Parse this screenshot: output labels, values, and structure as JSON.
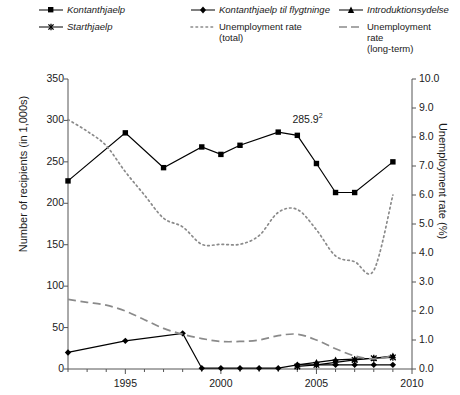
{
  "legend": {
    "rows": [
      [
        {
          "marker": "square-marker-line",
          "label": "Kontanthjaelp",
          "italic": true
        },
        {
          "marker": "diamond-marker-line",
          "label": "Kontanthjaelp til flygtninge",
          "italic": true
        },
        {
          "marker": "triangle-marker-line",
          "label": "Introduktionsydelse",
          "italic": true
        }
      ],
      [
        {
          "marker": "cross-marker-line",
          "label": "Starthjaelp",
          "italic": true
        },
        {
          "marker": "dotted-line",
          "label": "Unemployment rate\n(total)",
          "italic": false
        },
        {
          "marker": "dashed-line",
          "label": "Unemployment rate\n(long-term)",
          "italic": false
        }
      ]
    ]
  },
  "chart_data": {
    "type": "line",
    "title": "",
    "xlabel": "",
    "ylabel": "Number of recipients (in 1,000s)",
    "y2label": "Unemployment rate (%)",
    "xlim": [
      1992,
      2010
    ],
    "ylim": [
      0,
      350
    ],
    "y2lim": [
      0.0,
      10.0
    ],
    "xticks": [
      1995,
      2000,
      2005,
      2010
    ],
    "xtick_labels": [
      "1995",
      "2000",
      "2005",
      "2010"
    ],
    "yticks": [
      0,
      50,
      100,
      150,
      200,
      250,
      300,
      350
    ],
    "ytick_labels": [
      "0",
      "50",
      "100",
      "150",
      "200",
      "250",
      "300",
      "350"
    ],
    "y2ticks": [
      0.0,
      1.0,
      2.0,
      3.0,
      4.0,
      5.0,
      6.0,
      7.0,
      8.0,
      9.0,
      10.0
    ],
    "y2tick_labels": [
      "0.0",
      "1.0",
      "2.0",
      "3.0",
      "4.0",
      "5.0",
      "6.0",
      "7.0",
      "8.0",
      "9.0",
      "10.0"
    ],
    "x_minor_step": 1,
    "grid": false,
    "legend_position": "top",
    "annotations": [
      {
        "name": "peak-value-label",
        "text": "285.9",
        "superscript": "2",
        "x": 2005,
        "y": 285.9
      }
    ],
    "series": [
      {
        "name": "Kontanthjaelp",
        "axis": "left",
        "style": "solid",
        "marker": "square",
        "color": "#000000",
        "x": [
          1992,
          1993,
          1994,
          1995,
          1996,
          1997,
          1998,
          1999,
          2000,
          2001,
          2002,
          2003,
          2004,
          2005,
          2006,
          2007,
          2008,
          2009
        ],
        "y": [
          227,
          null,
          null,
          285,
          null,
          243,
          null,
          268,
          259,
          270,
          null,
          285.9,
          282,
          248,
          213,
          213,
          null,
          250
        ]
      },
      {
        "name": "Kontanthjaelp til flygtninge",
        "axis": "left",
        "style": "solid",
        "marker": "diamond",
        "color": "#000000",
        "x": [
          1992,
          1995,
          1998,
          1999,
          2000,
          2001,
          2002,
          2003,
          2004,
          2005,
          2006,
          2007,
          2008,
          2009
        ],
        "y": [
          20,
          34,
          43,
          1,
          1,
          1,
          1,
          1,
          5,
          5,
          5,
          5,
          5,
          5
        ]
      },
      {
        "name": "Introduktionsydelse",
        "axis": "left",
        "style": "solid",
        "marker": "triangle",
        "color": "#000000",
        "x": [
          2004,
          2005,
          2006,
          2007,
          2008,
          2009
        ],
        "y": [
          5,
          8,
          11,
          12,
          13,
          16
        ]
      },
      {
        "name": "Starthjaelp",
        "axis": "left",
        "style": "solid",
        "marker": "cross",
        "color": "#000000",
        "x": [
          2004,
          2005,
          2006,
          2007,
          2008,
          2009
        ],
        "y": [
          3,
          5,
          8,
          11,
          13,
          14
        ]
      },
      {
        "name": "Unemployment rate (total)",
        "axis": "right",
        "style": "dotted",
        "marker": "none",
        "color": "#8a8a8a",
        "x": [
          1992,
          1993,
          1994,
          1995,
          1996,
          1997,
          1998,
          1999,
          2000,
          2001,
          2002,
          2003,
          2004,
          2005,
          2006,
          2007,
          2008,
          2009
        ],
        "y": [
          8.6,
          8.2,
          7.7,
          6.8,
          6.0,
          5.2,
          4.9,
          4.3,
          4.3,
          4.3,
          4.6,
          5.4,
          5.5,
          4.8,
          3.9,
          3.7,
          3.4,
          6.0
        ]
      },
      {
        "name": "Unemployment rate (long-term)",
        "axis": "right",
        "style": "dashed",
        "marker": "none",
        "color": "#8a8a8a",
        "x": [
          1992,
          1993,
          1994,
          1995,
          1996,
          1997,
          1998,
          1999,
          2000,
          2001,
          2002,
          2003,
          2004,
          2005,
          2006,
          2007,
          2008,
          2009
        ],
        "y": [
          2.4,
          2.3,
          2.2,
          2.0,
          1.7,
          1.4,
          1.2,
          1.05,
          0.95,
          0.95,
          1.0,
          1.15,
          1.2,
          1.0,
          0.7,
          0.45,
          0.35,
          0.45
        ]
      }
    ]
  }
}
